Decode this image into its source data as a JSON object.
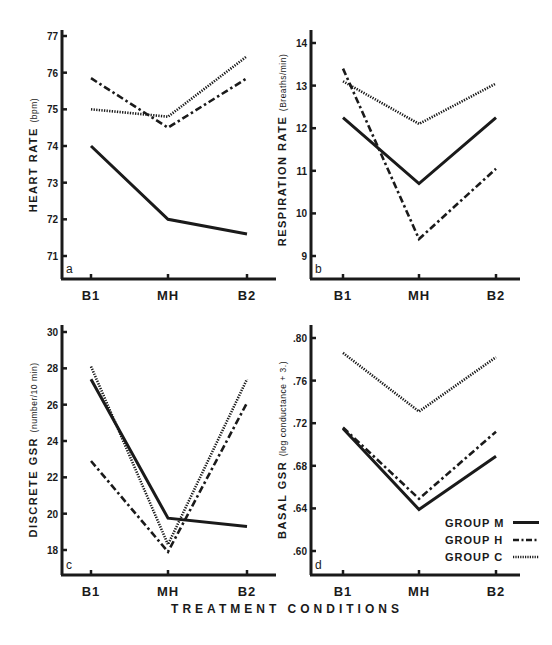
{
  "figure": {
    "x_title": "TREATMENT CONDITIONS",
    "legend": [
      {
        "label": "GROUP M",
        "style": "solid"
      },
      {
        "label": "GROUP H",
        "style": "dashdot"
      },
      {
        "label": "GROUP C",
        "style": "dotted"
      }
    ],
    "line_color": "#1a1a1a"
  },
  "chart_data": [
    {
      "type": "line",
      "panel": "a",
      "title": "",
      "xlabel": "",
      "ylabel": "HEART RATE",
      "ylabel_unit": "(bpm)",
      "categories": [
        "B1",
        "MH",
        "B2"
      ],
      "yticks": [
        71,
        72,
        73,
        74,
        75,
        76,
        77
      ],
      "ytick_labels": [
        "71",
        "72",
        "73",
        "74",
        "75",
        "76",
        "77"
      ],
      "ylim": [
        70.8,
        77.2
      ],
      "grid": false,
      "series": [
        {
          "name": "Group M",
          "style": "solid",
          "values": [
            74.0,
            72.0,
            71.6
          ]
        },
        {
          "name": "Group H",
          "style": "dashdot",
          "values": [
            75.85,
            74.5,
            75.85
          ]
        },
        {
          "name": "Group C",
          "style": "dotted",
          "values": [
            75.0,
            74.8,
            76.45
          ]
        }
      ]
    },
    {
      "type": "line",
      "panel": "b",
      "title": "",
      "xlabel": "",
      "ylabel": "RESPIRATION RATE",
      "ylabel_unit": "(Breaths/min)",
      "categories": [
        "B1",
        "MH",
        "B2"
      ],
      "yticks": [
        9,
        10,
        11,
        12,
        13,
        14
      ],
      "ytick_labels": [
        "9",
        "10",
        "11",
        "12",
        "13",
        "14"
      ],
      "ylim": [
        8.7,
        14.3
      ],
      "grid": false,
      "series": [
        {
          "name": "Group M",
          "style": "solid",
          "values": [
            12.25,
            10.7,
            12.25
          ]
        },
        {
          "name": "Group H",
          "style": "dashdot",
          "values": [
            13.4,
            9.4,
            11.05
          ]
        },
        {
          "name": "Group C",
          "style": "dotted",
          "values": [
            13.1,
            12.1,
            13.05
          ]
        }
      ]
    },
    {
      "type": "line",
      "panel": "c",
      "title": "",
      "xlabel": "",
      "ylabel": "DISCRETE GSR",
      "ylabel_unit": "(number/10 min)",
      "categories": [
        "B1",
        "MH",
        "B2"
      ],
      "yticks": [
        18,
        20,
        22,
        24,
        26,
        28,
        30
      ],
      "ytick_labels": [
        "18",
        "20",
        "22",
        "24",
        "26",
        "28",
        "30"
      ],
      "ylim": [
        17.0,
        30.4
      ],
      "grid": false,
      "series": [
        {
          "name": "Group M",
          "style": "solid",
          "values": [
            27.4,
            19.75,
            19.3
          ]
        },
        {
          "name": "Group H",
          "style": "dashdot",
          "values": [
            22.9,
            17.9,
            26.1
          ]
        },
        {
          "name": "Group C",
          "style": "dotted",
          "values": [
            28.1,
            18.3,
            27.4
          ]
        }
      ]
    },
    {
      "type": "line",
      "panel": "d",
      "title": "",
      "xlabel": "",
      "ylabel": "BASAL GSR",
      "ylabel_unit": "(log conductance + 3.)",
      "categories": [
        "B1",
        "MH",
        "B2"
      ],
      "yticks": [
        0.6,
        0.64,
        0.68,
        0.72,
        0.76,
        0.8
      ],
      "ytick_labels": [
        ".60",
        ".64",
        ".68",
        ".72",
        ".76",
        ".80"
      ],
      "ylim": [
        0.59,
        0.81
      ],
      "grid": false,
      "series": [
        {
          "name": "Group M",
          "style": "solid",
          "values": [
            0.715,
            0.639,
            0.689
          ]
        },
        {
          "name": "Group H",
          "style": "dashdot",
          "values": [
            0.716,
            0.649,
            0.712
          ]
        },
        {
          "name": "Group C",
          "style": "dotted",
          "values": [
            0.786,
            0.731,
            0.782
          ]
        }
      ]
    }
  ]
}
